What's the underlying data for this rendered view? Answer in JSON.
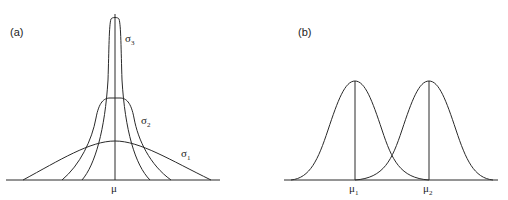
{
  "panels": [
    {
      "label": "(a)",
      "mean_label": "μ",
      "curves": [
        {
          "name": "σ",
          "sub": "3",
          "description": "narrow tall peak"
        },
        {
          "name": "σ",
          "sub": "2",
          "description": "medium"
        },
        {
          "name": "σ",
          "sub": "1",
          "description": "wide flat"
        }
      ]
    },
    {
      "label": "(b)",
      "means": [
        {
          "name": "μ",
          "sub": "1"
        },
        {
          "name": "μ",
          "sub": "2"
        }
      ]
    }
  ],
  "colors": {
    "line": "#2a2a2a",
    "background": "#ffffff"
  }
}
